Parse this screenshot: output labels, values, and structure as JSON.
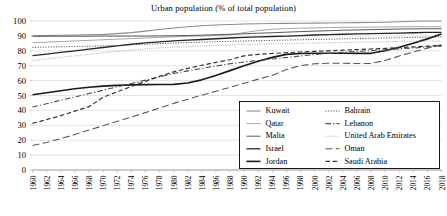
{
  "chart_data": {
    "type": "line",
    "title": "Urban population (% of total population)",
    "xlabel": "",
    "ylabel": "",
    "ylim": [
      0,
      100
    ],
    "ytick_values": [
      0,
      10,
      20,
      30,
      40,
      50,
      60,
      70,
      80,
      90,
      100
    ],
    "ytick_labels": [
      "0",
      "10",
      "20",
      "30",
      "40",
      "50",
      "60",
      "70",
      "80",
      "90",
      "100"
    ],
    "grid": true,
    "legend_position": "inside-lower-right",
    "x": [
      1960,
      1962,
      1964,
      1966,
      1968,
      1970,
      1972,
      1974,
      1976,
      1978,
      1980,
      1982,
      1984,
      1986,
      1988,
      1990,
      1992,
      1994,
      1996,
      1998,
      2000,
      2002,
      2004,
      2006,
      2008,
      2010,
      2012,
      2014,
      2016,
      2018
    ],
    "xtick_labels": [
      "1960",
      "1962",
      "1964",
      "1966",
      "1968",
      "1970",
      "1972",
      "1974",
      "1976",
      "1978",
      "1980",
      "1982",
      "1984",
      "1986",
      "1988",
      "1990",
      "1992",
      "1994",
      "1996",
      "1998",
      "2000",
      "2002",
      "2004",
      "2006",
      "2008",
      "2010",
      "2012",
      "2014",
      "2016",
      "2018"
    ],
    "series": [
      {
        "name": "Kuwait",
        "style": "solid",
        "color": "#8c8c8c",
        "width": 1.1,
        "values": [
          90.0,
          90.2,
          90.4,
          90.6,
          90.8,
          91.0,
          91.5,
          92.2,
          93.2,
          94.3,
          95.3,
          96.1,
          96.8,
          97.3,
          97.7,
          98.0,
          98.2,
          98.3,
          98.4,
          98.5,
          98.6,
          98.7,
          98.8,
          98.9,
          99.0,
          99.2,
          99.5,
          99.8,
          100.0,
          100.0
        ]
      },
      {
        "name": "Qatar",
        "style": "solid",
        "color": "#a6a6a6",
        "width": 1.0,
        "values": [
          85.4,
          85.8,
          86.2,
          86.6,
          87.0,
          87.4,
          87.8,
          88.2,
          88.6,
          89.0,
          89.4,
          89.7,
          90.0,
          90.3,
          90.6,
          92.2,
          93.6,
          94.5,
          94.9,
          95.2,
          95.4,
          95.6,
          95.7,
          95.8,
          95.9,
          96.0,
          96.1,
          96.2,
          96.2,
          96.2
        ]
      },
      {
        "name": "Malta",
        "style": "solid",
        "color": "#595959",
        "width": 1.0,
        "values": [
          89.8,
          89.8,
          89.8,
          89.8,
          89.8,
          89.9,
          89.9,
          89.9,
          89.9,
          90.0,
          90.1,
          90.3,
          90.5,
          90.8,
          91.1,
          91.4,
          91.8,
          92.1,
          92.5,
          92.9,
          93.2,
          93.5,
          93.8,
          94.0,
          94.2,
          94.4,
          94.6,
          94.7,
          94.8,
          94.8
        ]
      },
      {
        "name": "Israel",
        "style": "solid",
        "color": "#262626",
        "width": 1.3,
        "values": [
          76.8,
          77.8,
          78.9,
          80.0,
          81.1,
          82.2,
          83.3,
          84.4,
          85.3,
          86.0,
          86.6,
          87.1,
          87.6,
          88.1,
          88.6,
          89.0,
          89.3,
          89.6,
          89.9,
          90.2,
          90.6,
          90.9,
          91.1,
          91.3,
          91.5,
          91.7,
          91.9,
          92.1,
          92.3,
          92.4
        ]
      },
      {
        "name": "Jordan",
        "style": "solid",
        "color": "#1a1a1a",
        "width": 1.6,
        "values": [
          50.5,
          51.8,
          53.2,
          54.5,
          55.5,
          56.3,
          56.8,
          57.1,
          57.3,
          57.4,
          57.5,
          58.4,
          60.5,
          63.5,
          66.7,
          70.0,
          73.0,
          75.6,
          77.6,
          78.2,
          78.4,
          78.4,
          78.4,
          78.3,
          78.3,
          80.0,
          82.4,
          85.0,
          88.0,
          91.2
        ]
      },
      {
        "name": "Bahrain",
        "style": "dotted",
        "color": "#4d4d4d",
        "width": 1.0,
        "values": [
          82.3,
          82.5,
          82.7,
          82.9,
          83.1,
          83.3,
          83.6,
          84.0,
          84.4,
          84.8,
          85.2,
          85.5,
          85.8,
          86.1,
          86.4,
          86.6,
          86.8,
          87.0,
          87.2,
          87.4,
          87.6,
          87.8,
          88.0,
          88.2,
          88.4,
          88.6,
          88.8,
          89.0,
          89.2,
          89.3
        ]
      },
      {
        "name": "Lebanon",
        "style": "dashdot",
        "color": "#4d4d4d",
        "width": 1.1,
        "values": [
          42.3,
          44.5,
          46.8,
          49.0,
          51.3,
          53.5,
          55.8,
          58.0,
          60.3,
          62.5,
          64.8,
          66.5,
          68.2,
          69.8,
          71.3,
          72.5,
          73.5,
          74.5,
          75.5,
          76.5,
          77.5,
          78.3,
          79.0,
          79.6,
          80.1,
          80.7,
          81.3,
          81.9,
          82.5,
          83.1
        ]
      },
      {
        "name": "United Arab Emirates",
        "style": "finedot",
        "color": "#808080",
        "width": 0.9,
        "values": [
          73.5,
          74.5,
          75.6,
          76.6,
          77.6,
          78.6,
          79.6,
          80.5,
          81.3,
          81.9,
          82.4,
          82.8,
          83.2,
          83.6,
          83.9,
          84.2,
          84.5,
          84.7,
          84.9,
          85.1,
          85.3,
          85.4,
          85.6,
          85.8,
          85.9,
          86.1,
          86.3,
          86.4,
          86.5,
          86.5
        ]
      },
      {
        "name": "Oman",
        "style": "longdash",
        "color": "#595959",
        "width": 1.1,
        "values": [
          16.4,
          18.5,
          21.0,
          23.8,
          26.8,
          29.7,
          32.6,
          35.5,
          38.5,
          41.6,
          44.7,
          47.5,
          50.2,
          52.8,
          55.5,
          58.2,
          61.0,
          63.5,
          67.5,
          70.0,
          71.3,
          71.6,
          71.6,
          71.5,
          71.5,
          73.5,
          76.5,
          79.2,
          81.8,
          84.2
        ]
      },
      {
        "name": "Saudi Arabia",
        "style": "dashed",
        "color": "#333333",
        "width": 1.2,
        "values": [
          31.3,
          33.8,
          36.5,
          39.5,
          42.5,
          48.8,
          52.5,
          56.0,
          59.5,
          62.8,
          65.9,
          68.2,
          70.3,
          72.2,
          74.0,
          76.6,
          77.6,
          78.2,
          78.7,
          79.2,
          79.6,
          80.0,
          80.4,
          80.8,
          81.2,
          81.6,
          82.1,
          82.6,
          83.1,
          83.6
        ]
      }
    ],
    "legend_columns": [
      [
        "Kuwait",
        "Qatar",
        "Malta",
        "Israel",
        "Jordan"
      ],
      [
        "Bahrain",
        "Lebanon",
        "United Arab Emirates",
        "Oman",
        "Saudi Arabia"
      ]
    ]
  }
}
